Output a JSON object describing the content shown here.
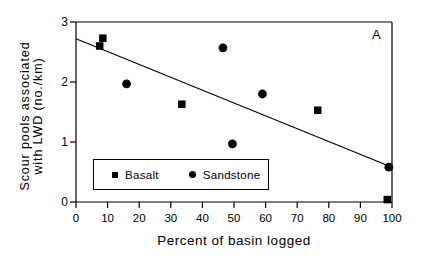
{
  "figure": {
    "panel_label": "A",
    "background_color": "#ffffff",
    "foreground_color": "#000000"
  },
  "axes": {
    "y_title_line1": "Scour pools associated",
    "y_title_line2": "with LWD (no./km)",
    "x_title": "Percent of basin logged"
  },
  "legend": {
    "items": [
      {
        "label": "Basalt",
        "marker": "square-marker",
        "color": "#000000"
      },
      {
        "label": "Sandstone",
        "marker": "circle-marker",
        "color": "#000000"
      }
    ]
  },
  "chart_data": {
    "type": "scatter",
    "title": "",
    "subtitle": "",
    "panel": "A",
    "xlabel": "Percent of basin logged",
    "ylabel": "Scour pools associated with LWD (no./km)",
    "xlim": [
      0,
      100
    ],
    "ylim": [
      0,
      3
    ],
    "xticks": [
      0,
      10,
      20,
      30,
      40,
      50,
      60,
      70,
      80,
      90,
      100
    ],
    "yticks": [
      0,
      1,
      2,
      3
    ],
    "xtick_labels": [
      "0",
      "10",
      "20",
      "30",
      "40",
      "50",
      "60",
      "70",
      "80",
      "90",
      "100"
    ],
    "ytick_labels": [
      "0",
      "1",
      "2",
      "3"
    ],
    "grid": false,
    "legend_position": "inside-lower-left",
    "series": [
      {
        "name": "Basalt",
        "marker": "square",
        "color": "#000000",
        "points": [
          {
            "x": 7.5,
            "y": 2.6
          },
          {
            "x": 8.5,
            "y": 2.73
          },
          {
            "x": 33.5,
            "y": 1.63
          },
          {
            "x": 76.5,
            "y": 1.53
          },
          {
            "x": 98.5,
            "y": 0.04
          }
        ]
      },
      {
        "name": "Sandstone",
        "marker": "circle",
        "color": "#000000",
        "points": [
          {
            "x": 16.0,
            "y": 1.97
          },
          {
            "x": 46.5,
            "y": 2.57
          },
          {
            "x": 49.5,
            "y": 0.97
          },
          {
            "x": 59.0,
            "y": 1.8
          },
          {
            "x": 99.0,
            "y": 0.58
          }
        ]
      }
    ],
    "trendline": {
      "name": "regression-line",
      "x_start": 0,
      "y_start": 2.72,
      "x_end": 100,
      "y_end": 0.58,
      "color": "#000000"
    }
  }
}
